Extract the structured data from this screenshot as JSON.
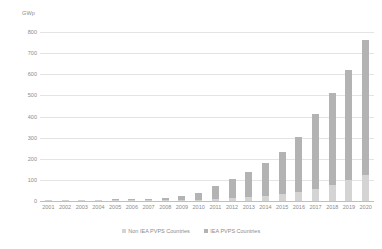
{
  "chart_data": {
    "type": "bar",
    "title": "",
    "subtitle": "",
    "xlabel": "",
    "ylabel": "GWp",
    "ylim": [
      0,
      800
    ],
    "ytick_step": 100,
    "grid": true,
    "stacked": true,
    "legend_position": "bottom",
    "yticks": [
      "800",
      "700",
      "600",
      "500",
      "400",
      "300",
      "200",
      "100",
      "0"
    ],
    "categories": [
      "2001",
      "2002",
      "2003",
      "2004",
      "2005",
      "2006",
      "2007",
      "2008",
      "2009",
      "2010",
      "2011",
      "2012",
      "2013",
      "2014",
      "2015",
      "2016",
      "2017",
      "2018",
      "2019",
      "2020"
    ],
    "series": [
      {
        "name": "Non IEA PVPS Countries",
        "color": "#d4d4d4",
        "values": [
          0.1,
          0.2,
          0.3,
          0.4,
          0.6,
          0.8,
          1.2,
          2,
          3,
          5,
          8,
          12,
          17,
          24,
          32,
          42,
          58,
          78,
          100,
          125
        ]
      },
      {
        "name": "IEA PVPS Countries",
        "color": "#b3b3b3",
        "values": [
          1.3,
          1.8,
          2.4,
          3.3,
          4.4,
          5.7,
          7.6,
          12,
          20,
          35,
          65,
          91,
          121,
          154,
          198,
          263,
          352,
          434,
          520,
          635
        ]
      }
    ],
    "totals": [
      1.4,
      2.0,
      2.7,
      3.7,
      5.0,
      6.5,
      8.8,
      14,
      23,
      40,
      73,
      103,
      138,
      178,
      230,
      305,
      410,
      512,
      620,
      760
    ]
  },
  "legend": {
    "items": [
      {
        "label": "Non IEA PVPS Countries"
      },
      {
        "label": "IEA PVPS Countries"
      }
    ]
  },
  "colors": {
    "non_iea": "#d4d4d4",
    "iea": "#b3b3b3",
    "gridline": "#e4e4e4",
    "axis": "#bfbfbf",
    "text": "#8c8c8c",
    "background": "#ffffff"
  }
}
